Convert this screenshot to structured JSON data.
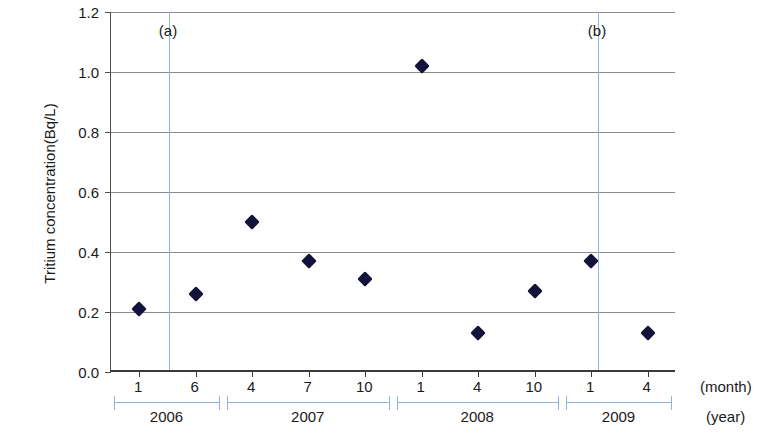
{
  "chart_data": {
    "type": "scatter",
    "title": "",
    "xlabel": "(month)",
    "ylabel": "Tritium concentration(Bq/L)",
    "ylim": [
      0.0,
      1.2
    ],
    "ytick_labels": [
      "0.0",
      "0.2",
      "0.4",
      "0.6",
      "0.8",
      "1.0",
      "1.2"
    ],
    "ytick_values": [
      0.0,
      0.2,
      0.4,
      0.6,
      0.8,
      1.0,
      1.2
    ],
    "grid": true,
    "legend": "none",
    "marker": "diamond",
    "marker_color": "#13123a",
    "x_categories": [
      "1",
      "6",
      "4",
      "7",
      "10",
      "1",
      "4",
      "10",
      "1",
      "4"
    ],
    "values": [
      0.21,
      0.26,
      0.5,
      0.37,
      0.31,
      1.02,
      0.13,
      0.27,
      0.37,
      0.13
    ],
    "points": [
      {
        "month": "1",
        "year": "2006",
        "value": 0.21
      },
      {
        "month": "6",
        "year": "2006",
        "value": 0.26
      },
      {
        "month": "4",
        "year": "2007",
        "value": 0.5
      },
      {
        "month": "7",
        "year": "2007",
        "value": 0.37
      },
      {
        "month": "10",
        "year": "2007",
        "value": 0.31
      },
      {
        "month": "1",
        "year": "2008",
        "value": 1.02
      },
      {
        "month": "4",
        "year": "2008",
        "value": 0.13
      },
      {
        "month": "10",
        "year": "2008",
        "value": 0.27
      },
      {
        "month": "1",
        "year": "2009",
        "value": 0.37
      },
      {
        "month": "4",
        "year": "2009",
        "value": 0.13
      }
    ],
    "year_groups": [
      {
        "label": "2006",
        "months": [
          "1",
          "6"
        ]
      },
      {
        "label": "2007",
        "months": [
          "4",
          "7",
          "10"
        ]
      },
      {
        "label": "2008",
        "months": [
          "1",
          "4",
          "10"
        ]
      },
      {
        "label": "2009",
        "months": [
          "1",
          "4"
        ]
      }
    ],
    "year_axis_label": "(year)",
    "annotations": [
      {
        "label": "(a)",
        "x_fraction": 0.1027,
        "color": "#8fb4de"
      },
      {
        "label": "(b)",
        "x_fraction": 0.8619,
        "color": "#8fb4de"
      }
    ]
  }
}
